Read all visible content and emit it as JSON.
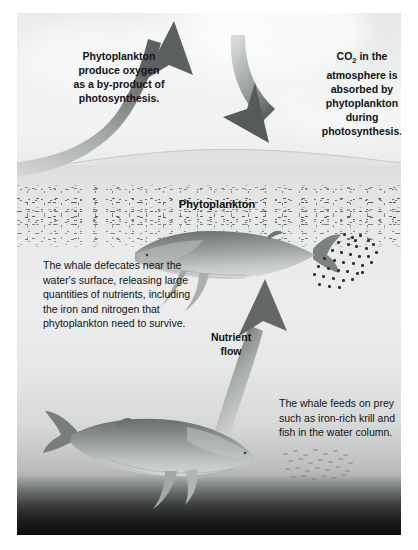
{
  "diagram": {
    "labels": {
      "oxygen": "Phytoplankton produce oxygen as a by-product of photosynthesis.",
      "oxygen_lines": [
        "Phytoplankton",
        "produce oxygen",
        "as a by-product of",
        "photosynthesis."
      ],
      "co2_lines": [
        "CO",
        "2",
        " in the",
        "atmosphere is",
        "absorbed by",
        "phytoplankton",
        "during",
        "photosynthesis."
      ],
      "co2_line1_pre": "CO",
      "co2_line1_sub": "2",
      "co2_line1_post": " in the",
      "co2_line2": "atmosphere is",
      "co2_line3": "absorbed by",
      "co2_line4": "phytoplankton",
      "co2_line5": "during",
      "co2_line6": "photosynthesis.",
      "phytoplankton": "Phytoplankton",
      "defecate": "The whale defecates near the water's surface, releasing large quantities of nutrients, including the iron and nitrogen that phytoplankton need to survive.",
      "nutrient_flow_line1": "Nutrient",
      "nutrient_flow_line2": "flow",
      "feeds": "The whale feeds on prey such as iron-rich krill and fish in the water column."
    },
    "elements": {
      "upward_arrow": "oxygen-release-arrow",
      "downward_arrow": "co2-absorption-arrow",
      "nutrient_arrow": "nutrient-flow-arrow",
      "upper_whale": "whale-near-surface",
      "lower_whale": "whale-feeding-deep",
      "krill_swarm": "krill-swarm",
      "fish_school": "fish-school",
      "plankton_layer": "phytoplankton-layer"
    },
    "colors": {
      "arrow_dark": "#5f6462",
      "arrow_light": "#c9cccb",
      "text": "#111314",
      "ocean_top": "#e9ebea",
      "ocean_floor": "#2b2e2e",
      "sky": "#e6e8e8"
    }
  }
}
